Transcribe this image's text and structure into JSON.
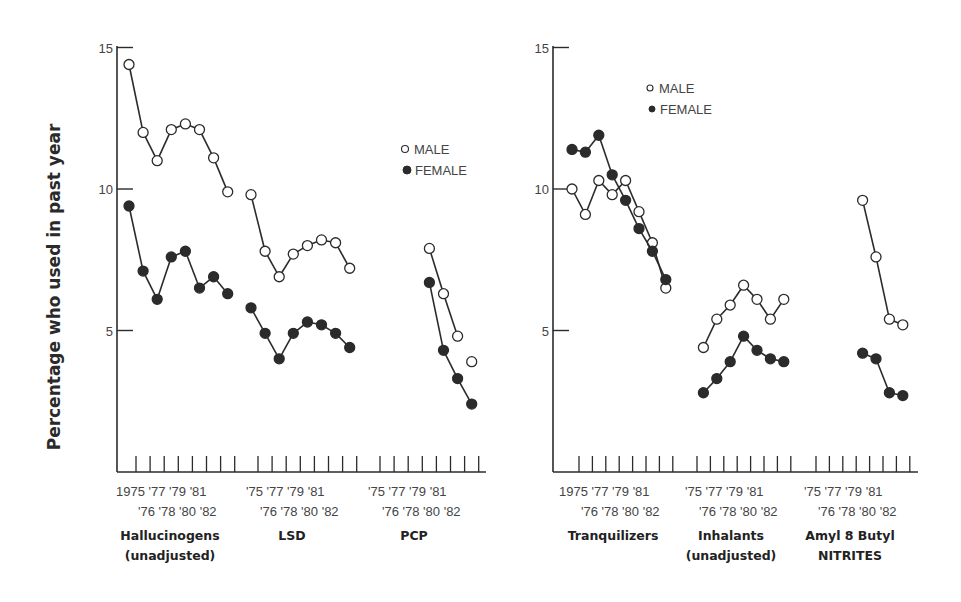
{
  "chart_data": [
    {
      "type": "line",
      "title": "",
      "ylabel": "Percentage who used in past year",
      "xlabel": "",
      "ylim": [
        0,
        15
      ],
      "yticks": [
        5,
        10,
        15
      ],
      "grid": false,
      "legend": {
        "position": "upper right",
        "entries": [
          "MALE",
          "FEMALE"
        ]
      },
      "groups": [
        {
          "name": "Hallucinogens (unadjusted)",
          "label_lines": [
            "Hallucinogens",
            "(unadjusted)"
          ],
          "x": [
            1975,
            1976,
            1977,
            1978,
            1979,
            1980,
            1981,
            1982
          ],
          "series": [
            {
              "name": "MALE",
              "values": [
                14.4,
                12.0,
                11.0,
                12.1,
                12.3,
                12.1,
                11.1,
                9.9
              ]
            },
            {
              "name": "FEMALE",
              "values": [
                9.4,
                7.1,
                6.1,
                7.6,
                7.8,
                6.5,
                6.9,
                6.3
              ]
            }
          ]
        },
        {
          "name": "LSD",
          "label_lines": [
            "LSD"
          ],
          "x": [
            1975,
            1976,
            1977,
            1978,
            1979,
            1980,
            1981,
            1982
          ],
          "series": [
            {
              "name": "MALE",
              "values": [
                9.8,
                7.8,
                6.9,
                7.7,
                8.0,
                8.2,
                8.1,
                7.2
              ]
            },
            {
              "name": "FEMALE",
              "values": [
                5.8,
                4.9,
                4.0,
                4.9,
                5.3,
                5.2,
                4.9,
                4.4
              ]
            }
          ]
        },
        {
          "name": "PCP",
          "label_lines": [
            "PCP"
          ],
          "x": [
            1979,
            1980,
            1981,
            1982
          ],
          "series": [
            {
              "name": "MALE",
              "values": [
                7.9,
                6.3,
                4.8,
                3.9
              ],
              "connected": [
                true,
                true,
                true,
                false
              ]
            },
            {
              "name": "FEMALE",
              "values": [
                6.7,
                4.3,
                3.3,
                2.4
              ]
            }
          ]
        }
      ]
    },
    {
      "type": "line",
      "title": "",
      "ylabel": "Percentage who used in past year",
      "xlabel": "",
      "ylim": [
        0,
        15
      ],
      "yticks": [
        5,
        10,
        15
      ],
      "grid": false,
      "legend": {
        "position": "upper left",
        "entries": [
          "MALE",
          "FEMALE"
        ]
      },
      "groups": [
        {
          "name": "Tranquilizers",
          "label_lines": [
            "Tranquilizers"
          ],
          "x": [
            1975,
            1976,
            1977,
            1978,
            1979,
            1980,
            1981,
            1982
          ],
          "series": [
            {
              "name": "MALE",
              "values": [
                10.0,
                9.1,
                10.3,
                9.8,
                10.3,
                9.2,
                8.1,
                6.5
              ]
            },
            {
              "name": "FEMALE",
              "values": [
                11.4,
                11.3,
                11.9,
                10.5,
                9.6,
                8.6,
                7.8,
                6.8
              ]
            }
          ]
        },
        {
          "name": "Inhalants (unadjusted)",
          "label_lines": [
            "Inhalants",
            "(unadjusted)"
          ],
          "x": [
            1976,
            1977,
            1978,
            1979,
            1980,
            1981,
            1982
          ],
          "series": [
            {
              "name": "MALE",
              "values": [
                4.4,
                5.4,
                5.9,
                6.6,
                6.1,
                5.4,
                6.1
              ]
            },
            {
              "name": "FEMALE",
              "values": [
                2.8,
                3.3,
                3.9,
                4.8,
                4.3,
                4.0,
                3.9
              ]
            }
          ]
        },
        {
          "name": "Amyl 8 Butyl NITRITES",
          "label_lines": [
            "Amyl 8 Butyl",
            "NITRITES"
          ],
          "x": [
            1979,
            1980,
            1981,
            1982
          ],
          "series": [
            {
              "name": "MALE",
              "values": [
                9.6,
                7.6,
                5.4,
                5.2
              ]
            },
            {
              "name": "FEMALE",
              "values": [
                4.2,
                4.0,
                2.8,
                2.7
              ]
            }
          ]
        }
      ]
    }
  ],
  "axis": {
    "ylabel": "Percentage who used in past year",
    "yticks": [
      "15",
      "10",
      "5"
    ],
    "xticks_top_first": [
      "1975",
      "'77",
      "'79",
      "'81"
    ],
    "xticks_top_other": [
      "'75",
      "'77",
      "'79",
      "'81"
    ],
    "xticks_bottom": [
      "'76",
      "'78",
      "'80",
      "'82"
    ]
  },
  "legend": {
    "male": "MALE",
    "female": "FEMALE"
  },
  "colors": {
    "line": "#2b2b2b",
    "female_fill": "#2b2b2b",
    "male_fill": "#ffffff"
  }
}
